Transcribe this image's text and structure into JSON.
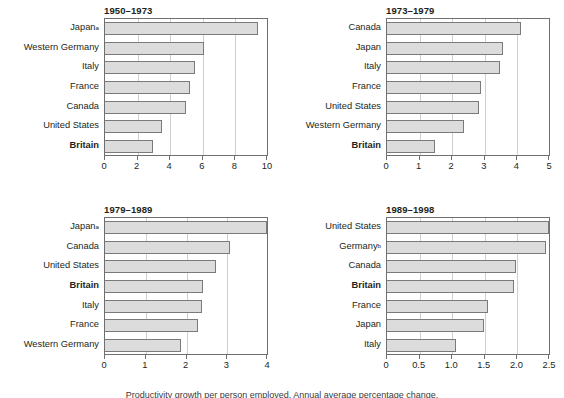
{
  "figure": {
    "background": "#ffffff",
    "bar_fill": "#dcdcdc",
    "bar_stroke": "#7a7a7a",
    "axis_color": "#6f6f6f",
    "gridline_color": "#cfcfcf",
    "footnote_partial": "Productivity growth per person employed. Annual average percentage change."
  },
  "chart_data": [
    {
      "type": "bar",
      "orientation": "horizontal",
      "title": "1950–1973",
      "xlabel": "",
      "ylabel": "",
      "xlim": [
        0,
        10
      ],
      "xticks": [
        0,
        2,
        4,
        6,
        8,
        10
      ],
      "xticklabels": [
        "0",
        "2",
        "4",
        "6",
        "8",
        "10"
      ],
      "grid": true,
      "highlight": "Britain",
      "categories": [
        "Japan",
        "Western Germany",
        "Italy",
        "France",
        "Canada",
        "United States",
        "Britain"
      ],
      "category_marks": [
        "a",
        "",
        "",
        "",
        "",
        "",
        ""
      ],
      "values": [
        9.45,
        6.15,
        5.6,
        5.3,
        5.05,
        3.55,
        3.0
      ]
    },
    {
      "type": "bar",
      "orientation": "horizontal",
      "title": "1973–1979",
      "xlabel": "",
      "ylabel": "",
      "xlim": [
        0,
        5
      ],
      "xticks": [
        0,
        1,
        2,
        3,
        4,
        5
      ],
      "xticklabels": [
        "0",
        "1",
        "2",
        "3",
        "4",
        "5"
      ],
      "grid": true,
      "highlight": "Britain",
      "categories": [
        "Canada",
        "Japan",
        "Italy",
        "France",
        "United States",
        "Western Germany",
        "Britain"
      ],
      "category_marks": [
        "",
        "",
        "",
        "",
        "",
        "",
        ""
      ],
      "values": [
        4.15,
        3.6,
        3.5,
        2.9,
        2.85,
        2.4,
        1.5
      ]
    },
    {
      "type": "bar",
      "orientation": "horizontal",
      "title": "1979–1989",
      "xlabel": "",
      "ylabel": "",
      "xlim": [
        0,
        4
      ],
      "xticks": [
        0,
        1,
        2,
        3,
        4
      ],
      "xticklabels": [
        "0",
        "1",
        "2",
        "3",
        "4"
      ],
      "grid": true,
      "highlight": "Britain",
      "categories": [
        "Japan",
        "Canada",
        "United States",
        "Britain",
        "Italy",
        "France",
        "Western Germany"
      ],
      "category_marks": [
        "a",
        "",
        "",
        "",
        "",
        "",
        ""
      ],
      "values": [
        4.0,
        3.1,
        2.75,
        2.42,
        2.4,
        2.3,
        1.88
      ]
    },
    {
      "type": "bar",
      "orientation": "horizontal",
      "title": "1989–1998",
      "xlabel": "",
      "ylabel": "",
      "xlim": [
        0,
        2.5
      ],
      "xticks": [
        0,
        0.5,
        1.0,
        1.5,
        2.0,
        2.5
      ],
      "xticklabels": [
        "0",
        "0.5",
        "1.0",
        "1.5",
        "2.0",
        "2.5"
      ],
      "grid": true,
      "highlight": "Britain",
      "categories": [
        "United States",
        "Germany",
        "Canada",
        "Britain",
        "France",
        "Japan",
        "Italy"
      ],
      "category_marks": [
        "",
        "b",
        "",
        "",
        "",
        "",
        ""
      ],
      "values": [
        2.5,
        2.45,
        2.0,
        1.96,
        1.56,
        1.5,
        1.07
      ]
    }
  ]
}
